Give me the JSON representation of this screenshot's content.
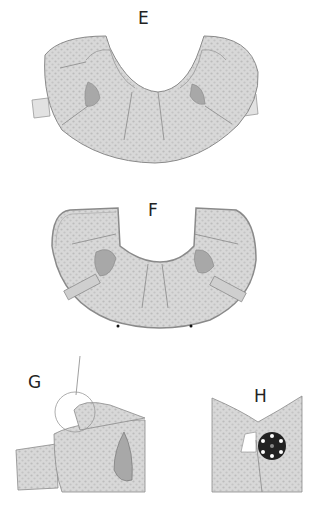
{
  "figure": {
    "type": "sewing instruction illustration",
    "steps": [
      {
        "id": "E",
        "label": "E",
        "description": "Collar piece with gathered neckline and darts"
      },
      {
        "id": "F",
        "label": "F",
        "description": "Collar with bias binding and edge stitching"
      },
      {
        "id": "G",
        "label": "G",
        "description": "Close-up of shoulder/sleeve detail with hand stitching"
      },
      {
        "id": "H",
        "label": "H",
        "description": "Front closure with button"
      }
    ]
  },
  "colors": {
    "fabric_fill": "#d6d6d6",
    "fabric_dots": "#bdbdbd",
    "outline": "#8a8a8a",
    "shading": "#a8a8a8",
    "button": "#222222",
    "button_holes": "#ffffff"
  }
}
